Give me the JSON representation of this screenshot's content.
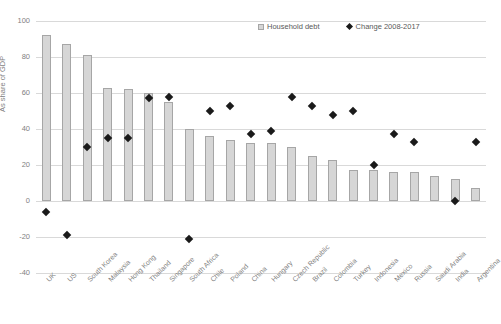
{
  "chart_data": {
    "type": "bar",
    "title": "",
    "xlabel": "",
    "ylabel": "As share of GDP",
    "ylim": [
      -40,
      100
    ],
    "yticks": [
      100,
      80,
      60,
      40,
      20,
      0,
      -20,
      -40
    ],
    "grid": true,
    "legend_position": "top-right",
    "categories": [
      "UK",
      "US",
      "South Korea",
      "Malaysia",
      "Hong Kong",
      "Thailand",
      "Singapore",
      "South Africa",
      "Chile",
      "Poland",
      "China",
      "Hungary",
      "Czech Republic",
      "Brazil",
      "Colombia",
      "Turkey",
      "Indonesia",
      "Mexico",
      "Russia",
      "Saudi Arabia",
      "India",
      "Argentina"
    ],
    "series": [
      {
        "name": "Household debt",
        "type": "bar",
        "color": "#d6d6d6",
        "values": [
          92,
          87,
          81,
          63,
          62,
          60,
          55,
          40,
          36,
          34,
          32,
          32,
          30,
          25,
          23,
          17,
          17,
          16,
          16,
          14,
          12,
          7
        ]
      },
      {
        "name": "Change 2008-2017",
        "type": "scatter",
        "color": "#1a1a1a",
        "values": [
          -6,
          -19,
          30,
          35,
          35,
          57,
          58,
          -21,
          50,
          53,
          37,
          39,
          58,
          53,
          48,
          50,
          20,
          37,
          33,
          null,
          0,
          33
        ]
      }
    ]
  },
  "legend": {
    "items": [
      {
        "label": "Household debt",
        "marker": "bar-swatch"
      },
      {
        "label": "Change 2008-2017",
        "marker": "diamond-marker"
      }
    ]
  }
}
